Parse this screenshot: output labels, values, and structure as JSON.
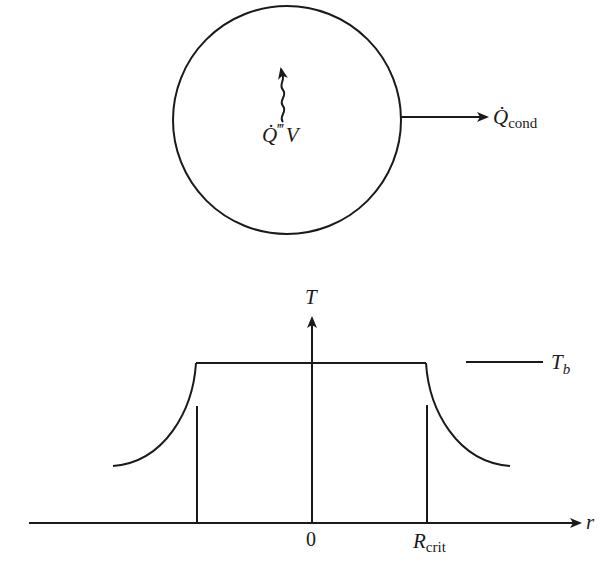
{
  "figure": {
    "top_panel": {
      "description": "Spherical region with volumetric heat generation and conductive heat loss",
      "generation_label": {
        "symbol": "Q̇",
        "primes": "‴",
        "suffix": "V"
      },
      "conduction_label": {
        "symbol": "Q̇",
        "subscript": "cond"
      }
    },
    "bottom_panel": {
      "description": "Temperature profile vs radius",
      "y_axis_label": "T",
      "x_axis_label": "r",
      "origin_label": "0",
      "critical_radius_label": {
        "main": "R",
        "subscript": "crit"
      },
      "reference_level_label": {
        "main": "T",
        "subscript": "b"
      }
    }
  },
  "colors": {
    "line": "#1a1a1a",
    "background": "#ffffff"
  }
}
